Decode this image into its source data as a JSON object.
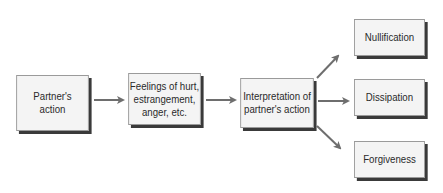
{
  "diagram": {
    "nodes": [
      {
        "id": "partners-action",
        "label": "Partner's action"
      },
      {
        "id": "feelings",
        "label": "Feelings of hurt, estrangement, anger, etc."
      },
      {
        "id": "interpretation",
        "label": "Interpretation of partner's action"
      },
      {
        "id": "nullification",
        "label": "Nullification"
      },
      {
        "id": "dissipation",
        "label": "Dissipation"
      },
      {
        "id": "forgiveness",
        "label": "Forgiveness"
      }
    ],
    "lines": {
      "partners_action": [
        "Partner's",
        "action"
      ],
      "feelings": [
        "Feelings of hurt,",
        "estrangement,",
        "anger, etc."
      ],
      "interpretation": [
        "Interpretation of",
        "partner's action"
      ]
    },
    "edges": [
      {
        "from": "partners-action",
        "to": "feelings"
      },
      {
        "from": "feelings",
        "to": "interpretation"
      },
      {
        "from": "interpretation",
        "to": "nullification"
      },
      {
        "from": "interpretation",
        "to": "dissipation"
      },
      {
        "from": "interpretation",
        "to": "forgiveness"
      }
    ],
    "colors": {
      "box_fill": "#f4f4f4",
      "shadow": "#3a3a3a",
      "arrow": "#6e6e6e",
      "text": "#2a2a2a"
    }
  }
}
